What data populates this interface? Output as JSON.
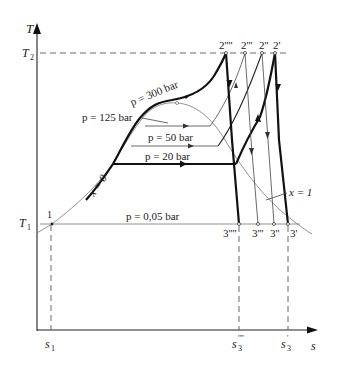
{
  "figure": {
    "type": "T-s diagram",
    "axes": {
      "y_label": "T",
      "x_label": "s",
      "y_ticks": [
        {
          "label": "T",
          "sub": "2",
          "level": "upper temperature"
        },
        {
          "label": "T",
          "sub": "1",
          "level": "lower temperature"
        }
      ],
      "x_ticks": [
        {
          "label": "s",
          "sub": "1",
          "sup": ""
        },
        {
          "label": "s",
          "sub": "3",
          "sup": "''''"
        },
        {
          "label": "s",
          "sub": "3",
          "sup": "'"
        }
      ]
    },
    "isobars": [
      {
        "label": "p = 300 bar",
        "weight": "thick"
      },
      {
        "label": "p = 125 bar",
        "weight": "thin"
      },
      {
        "label": "p = 50 bar",
        "weight": "thin"
      },
      {
        "label": "p = 20 bar",
        "weight": "thick"
      },
      {
        "label": "p = 0,05 bar",
        "weight": "thin"
      }
    ],
    "quality_lines": [
      {
        "label": "x = 0"
      },
      {
        "label": "x = 1"
      }
    ],
    "state_points": {
      "start": "1",
      "turbine_inlet": [
        "2''''",
        "2'''",
        "2''",
        "2'"
      ],
      "turbine_outlet": [
        "3''''",
        "3'''",
        "3''",
        "3'"
      ]
    }
  }
}
